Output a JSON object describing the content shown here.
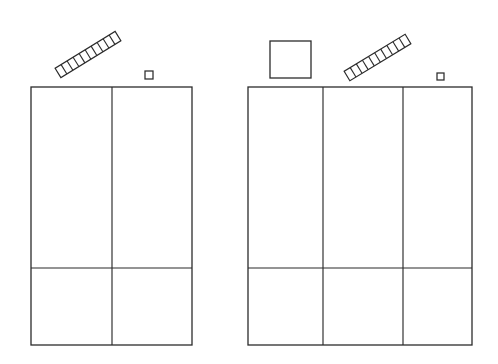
{
  "scene": {
    "title": "Two-panel line drawing with ladders and squares",
    "width": 498,
    "height": 364,
    "background_color": "#ffffff",
    "stroke_color": "#2b2b2b",
    "description": "Black-and-white outline drawing: two tall subdivided rectangular panels with small geometric shapes floating above them."
  },
  "objects": {
    "left_panel": {
      "name": "left-panel",
      "label": "Left panel",
      "x": 31,
      "y": 87,
      "width": 161,
      "height": 258,
      "columns": 2,
      "vertical_dividers": [
        112
      ],
      "horizontal_dividers": [
        268
      ],
      "fill_color": "#ffffff",
      "stroke_color": "#2b2b2b"
    },
    "right_panel": {
      "name": "right-panel",
      "label": "Right panel",
      "x": 248,
      "y": 87,
      "width": 224,
      "height": 258,
      "columns": 3,
      "vertical_dividers": [
        323,
        403
      ],
      "horizontal_dividers": [
        268
      ],
      "fill_color": "#ffffff",
      "stroke_color": "#2b2b2b"
    },
    "left_ladder": {
      "name": "left-ladder",
      "label": "Ladder above left panel",
      "x1": 58,
      "y1": 73,
      "x2": 118,
      "y2": 36,
      "rungs": 9,
      "thickness": 11,
      "angle_deg": -31,
      "stroke_color": "#2b2b2b"
    },
    "right_ladder": {
      "name": "right-ladder",
      "label": "Ladder above right panel",
      "x1": 347,
      "y1": 76,
      "x2": 408,
      "y2": 39,
      "rungs": 9,
      "thickness": 11,
      "angle_deg": -31,
      "stroke_color": "#2b2b2b"
    },
    "medium_square": {
      "name": "medium-square",
      "label": "Medium square above right panel",
      "x": 270,
      "y": 41,
      "width": 41,
      "height": 37,
      "fill_color": "#ffffff",
      "stroke_color": "#2b2b2b"
    },
    "left_small_square": {
      "name": "left-small-square",
      "label": "Small square above left panel",
      "x": 145,
      "y": 71,
      "width": 8,
      "height": 8,
      "fill_color": "#ffffff",
      "stroke_color": "#2b2b2b"
    },
    "right_small_square": {
      "name": "right-small-square",
      "label": "Small square above right panel",
      "x": 437,
      "y": 73,
      "width": 7,
      "height": 7,
      "fill_color": "#ffffff",
      "stroke_color": "#2b2b2b"
    }
  }
}
